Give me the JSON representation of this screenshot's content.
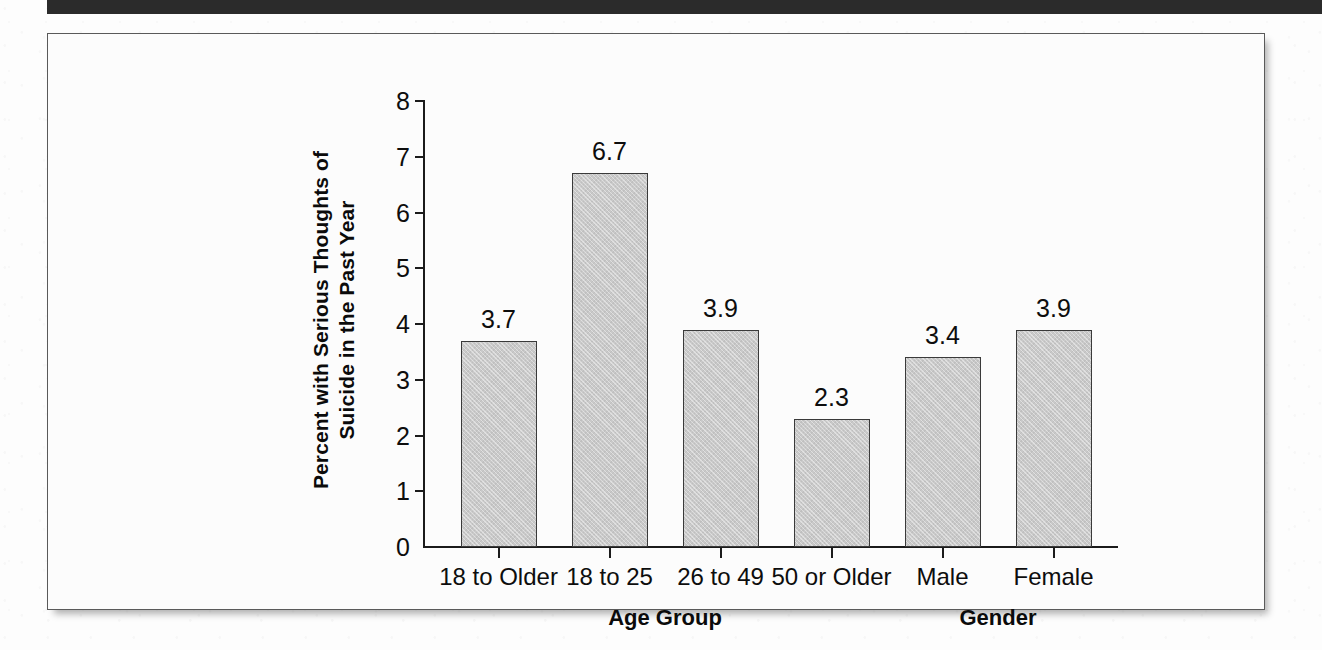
{
  "chart_data": {
    "type": "bar",
    "title": "",
    "xlabel": "",
    "ylabel": "Percent with Serious Thoughts of Suicide in the Past Year",
    "ylabel_line1": "Percent with Serious Thoughts of",
    "ylabel_line2": "Suicide in the Past Year",
    "categories": [
      "18 to Older",
      "18 to 25",
      "26 to 49",
      "50 or Older",
      "Male",
      "Female"
    ],
    "values": [
      3.7,
      6.7,
      3.9,
      2.3,
      3.4,
      3.9
    ],
    "value_labels": [
      "3.7",
      "6.7",
      "3.9",
      "2.3",
      "3.4",
      "3.9"
    ],
    "ylim": [
      0,
      8
    ],
    "ytick_values": [
      0,
      1,
      2,
      3,
      4,
      5,
      6,
      7,
      8
    ],
    "ytick_labels": [
      "0",
      "1",
      "2",
      "3",
      "4",
      "5",
      "6",
      "7",
      "8"
    ],
    "grid": false,
    "legend": "none",
    "group_labels": [
      {
        "label": "Age Group",
        "covers": [
          "18 to Older",
          "18 to 25",
          "26 to 49",
          "50 or Older"
        ]
      },
      {
        "label": "Gender",
        "covers": [
          "Male",
          "Female"
        ]
      }
    ],
    "bar_color": "#c9c9c9",
    "bar_edge_color": "#3a3a3a",
    "axis_color": "#1b1b1b",
    "text_color": "#0d0d0d"
  },
  "frame": {
    "border_color": "#5a5a5a",
    "background_color": "#fcfcfc"
  },
  "header_band": {
    "color": "#2b2b2b"
  }
}
